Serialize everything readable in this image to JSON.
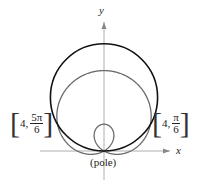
{
  "diagram": {
    "axes": {
      "x_label": "x",
      "y_label": "y"
    },
    "pole_label": "(pole)",
    "curves": [
      {
        "name": "circle",
        "equation": "r = 8 sin θ",
        "color": "#111111"
      },
      {
        "name": "limacon",
        "equation": "r = 2 + 4 sin θ",
        "color": "#666666"
      }
    ],
    "intersection_points": [
      {
        "r": "4,",
        "theta_num": "5π",
        "theta_den": "6"
      },
      {
        "r": "4,",
        "theta_num": "π",
        "theta_den": "6"
      }
    ]
  }
}
